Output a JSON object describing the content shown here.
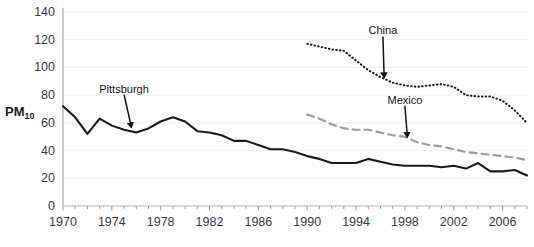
{
  "chart_data": {
    "type": "line",
    "title": "",
    "xlabel": "",
    "ylabel": "PM10",
    "ylabel_base": "PM",
    "ylabel_sub": "10",
    "xlim": [
      1970,
      2008
    ],
    "ylim": [
      0,
      140
    ],
    "grid": true,
    "grid_axis": "y",
    "legend": "none (inline annotated labels with arrows)",
    "yticks": [
      0,
      20,
      40,
      60,
      80,
      100,
      120,
      140
    ],
    "ytick_labels": [
      "0",
      "20",
      "40",
      "60",
      "80",
      "100",
      "120",
      "140"
    ],
    "xticks": [
      1970,
      1974,
      1978,
      1982,
      1986,
      1990,
      1994,
      1998,
      2002,
      2006
    ],
    "xtick_labels": [
      "1970",
      "1974",
      "1978",
      "1982",
      "1986",
      "1990",
      "1994",
      "1998",
      "2002",
      "2006"
    ],
    "xtick_minor_every": 1,
    "annotations": [
      {
        "text": "Pittsburgh",
        "label_x": 1975.0,
        "label_y": 84,
        "arrow_to_x": 1975.6,
        "arrow_to_y": 57
      },
      {
        "text": "China",
        "label_x": 1996.2,
        "label_y": 126,
        "arrow_to_x": 1996.3,
        "arrow_to_y": 93
      },
      {
        "text": "Mexico",
        "label_x": 1998.0,
        "label_y": 76,
        "arrow_to_x": 1998.2,
        "arrow_to_y": 50
      }
    ],
    "series": [
      {
        "name": "Pittsburgh",
        "style": "solid",
        "color": "#1a1a1a",
        "width": 2.1,
        "x": [
          1970,
          1971,
          1972,
          1973,
          1974,
          1975,
          1976,
          1977,
          1978,
          1979,
          1980,
          1981,
          1982,
          1983,
          1984,
          1985,
          1986,
          1987,
          1988,
          1989,
          1990,
          1991,
          1992,
          1993,
          1994,
          1995,
          1996,
          1997,
          1998,
          1999,
          2000,
          2001,
          2002,
          2003,
          2004,
          2005,
          2006,
          2007,
          2008
        ],
        "values": [
          72,
          64,
          52,
          63,
          58,
          55,
          53,
          56,
          61,
          64,
          61,
          54,
          53,
          51,
          47,
          47,
          44,
          41,
          41,
          39,
          36,
          34,
          31,
          31,
          31,
          34,
          32,
          30,
          29,
          29,
          29,
          28,
          29,
          27,
          31,
          25,
          25,
          26,
          22
        ]
      },
      {
        "name": "China",
        "style": "dotted",
        "color": "#1a1a1a",
        "width": 1.9,
        "x": [
          1990,
          1991,
          1992,
          1993,
          1994,
          1995,
          1996,
          1997,
          1998,
          1999,
          2000,
          2001,
          2002,
          2003,
          2004,
          2005,
          2006,
          2007,
          2008
        ],
        "values": [
          117,
          115,
          113,
          112,
          105,
          98,
          93,
          89,
          87,
          86,
          87,
          88,
          86,
          80,
          79,
          79,
          76,
          69,
          60
        ]
      },
      {
        "name": "Mexico",
        "style": "dashed",
        "color": "#9a9a9a",
        "width": 2.1,
        "x": [
          1990,
          1991,
          1992,
          1993,
          1994,
          1995,
          1996,
          1997,
          1998,
          1999,
          2000,
          2001,
          2002,
          2003,
          2004,
          2005,
          2006,
          2007,
          2008
        ],
        "values": [
          66,
          63,
          59,
          56,
          55,
          55,
          53,
          51,
          50,
          46,
          44,
          43,
          41,
          39,
          38,
          37,
          36,
          35,
          33
        ]
      }
    ]
  },
  "axis": {
    "y_axis_line_color": "#b5b5b5",
    "x_axis_line_color": "#b5b5b5",
    "gridline_color": "#f0f0f0"
  }
}
